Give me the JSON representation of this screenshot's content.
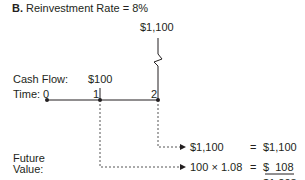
{
  "diagram": {
    "title_letter": "B.",
    "title_text": "Reinvestment Rate = 8%",
    "labels": {
      "cash_flow": "Cash Flow:",
      "time": "Time:",
      "future_value_line1": "Future",
      "future_value_line2": "Value:"
    },
    "timeline": {
      "periods": [
        "0",
        "1",
        "2"
      ]
    },
    "cash_flows": [
      {
        "period": "1",
        "amount": "$100"
      },
      {
        "period": "2",
        "amount": "$1,100"
      }
    ],
    "future_value_rows": [
      {
        "expression": "$1,100",
        "equals": "=",
        "result": "$1,100"
      },
      {
        "expression": "100 × 1.08",
        "equals": "=",
        "result": "$  108"
      }
    ],
    "total": "$1,208",
    "colors": {
      "text": "#231f20",
      "line": "#231f20",
      "dashed": "#555555"
    }
  }
}
